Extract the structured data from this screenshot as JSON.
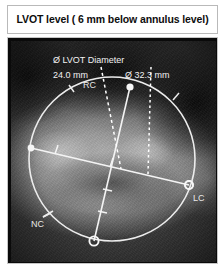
{
  "caption": {
    "title": "LVOT level ( 6 mm below annulus level)"
  },
  "scan": {
    "modality_view": "ct-cross-section-lvot",
    "annotations": {
      "measure_label": "Ø LVOT Diameter",
      "measure_min": "24.0 mm",
      "measure_max": "Ø 32.3 mm"
    },
    "cusp_labels": {
      "right": "RC",
      "left": "LC",
      "non": "NC"
    },
    "colors": {
      "overlay_line": "#f0f0f0",
      "text": "#f2f2f2",
      "background": "#0c0c0c"
    }
  }
}
